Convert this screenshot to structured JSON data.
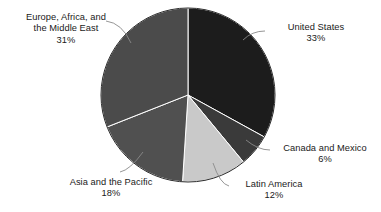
{
  "chart_data": {
    "type": "pie",
    "title": "",
    "subtitle": "",
    "xlabel": "",
    "ylabel": "",
    "legend_position": "none",
    "grid": false,
    "labels_position": "outside-with-leader-lines",
    "start_angle_deg": 0,
    "direction": "clockwise",
    "units": "percent",
    "categories": [
      "United States",
      "Canada and Mexico",
      "Latin America",
      "Asia and the Pacific",
      "Europe, Africa, and the Middle East"
    ],
    "values": [
      33,
      6,
      12,
      18,
      31
    ],
    "total": 100,
    "slices": [
      {
        "name": "United States",
        "name_line1": "United States",
        "value": 33,
        "value_label": "33%",
        "color": "#1c1c1c"
      },
      {
        "name": "Canada and Mexico",
        "name_line1": "Canada and Mexico",
        "value": 6,
        "value_label": "6%",
        "color": "#3a3a3a"
      },
      {
        "name": "Latin America",
        "name_line1": "Latin America",
        "value": 12,
        "value_label": "12%",
        "color": "#c9c9c9"
      },
      {
        "name": "Asia and the Pacific",
        "name_line1": "Asia and the Pacific",
        "value": 18,
        "value_label": "18%",
        "color": "#505050"
      },
      {
        "name": "Europe, Africa, and the Middle East",
        "name_line1": "Europe, Africa, and",
        "name_line2": "the Middle East",
        "value": 31,
        "value_label": "31%",
        "color": "#4b4b4b"
      }
    ]
  },
  "colors": {
    "background": "#ffffff",
    "text": "#1a1a1a",
    "slice_border": "#ffffff",
    "leader_line": "#8a8a8a",
    "pie_outline": "#2b2b2b"
  }
}
